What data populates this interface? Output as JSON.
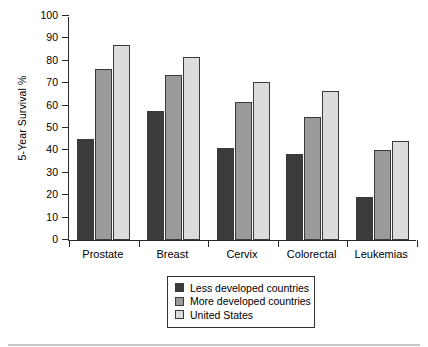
{
  "chart_data": {
    "type": "bar",
    "title": "",
    "xlabel": "",
    "ylabel": "5-Year Survival %",
    "ylim": [
      0,
      100
    ],
    "ytick_step": 10,
    "yticks": [
      100,
      90,
      80,
      70,
      60,
      50,
      40,
      30,
      20,
      10,
      0
    ],
    "grid": false,
    "legend_position": "bottom-center",
    "categories": [
      "Prostate",
      "Breast",
      "Cervix",
      "Colorectal",
      "Leukemias"
    ],
    "series": [
      {
        "name": "Less developed countries",
        "color": "#3b3b3b",
        "values": [
          45,
          57.5,
          41,
          38.5,
          19
        ]
      },
      {
        "name": "More developed countries",
        "color": "#9a9a9a",
        "values": [
          76.5,
          73.5,
          61.5,
          55,
          40
        ]
      },
      {
        "name": "United States",
        "color": "#dcdcdc",
        "values": [
          87,
          81.5,
          70.5,
          66.5,
          44
        ]
      }
    ]
  }
}
